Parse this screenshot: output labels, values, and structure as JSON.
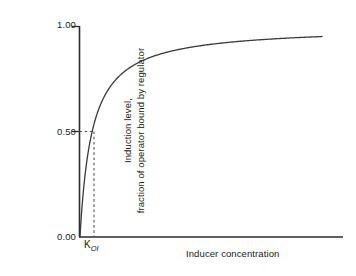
{
  "chart_data": {
    "type": "line",
    "title": "",
    "subtitle": "",
    "xlabel": "Inducer concentration",
    "ylabel": "Induction level, fraction of operator bound by regulator",
    "ylabel_lines": [
      "Induction level,",
      "fraction of operator bound by regulator"
    ],
    "ytick_labels": [
      "1.00",
      "0.50",
      "0.00"
    ],
    "ytick_values": [
      1.0,
      0.5,
      0.0
    ],
    "ylim": [
      0.0,
      1.0
    ],
    "xtick_labels": [
      "K",
      "OI"
    ],
    "xtick_annotation": "K_OI",
    "xlim": [
      0,
      20
    ],
    "grid": false,
    "legend": false,
    "series": [
      {
        "name": "fraction bound",
        "equation": "y = x / (K + x)",
        "K": 1.0,
        "x": [
          0,
          0.1,
          0.2,
          0.3,
          0.4,
          0.5,
          0.7,
          1.0,
          1.3,
          1.7,
          2.1,
          2.6,
          3.2,
          4.0,
          5.0,
          6.2,
          7.6,
          9.2,
          11.0,
          13.0,
          15.2,
          17.5,
          20.0
        ],
        "values": [
          0.0,
          0.091,
          0.167,
          0.231,
          0.286,
          0.333,
          0.412,
          0.5,
          0.565,
          0.63,
          0.677,
          0.722,
          0.762,
          0.8,
          0.833,
          0.861,
          0.884,
          0.902,
          0.917,
          0.929,
          0.938,
          0.946,
          0.952
        ]
      }
    ],
    "annotations": [
      {
        "name": "half-saturation-guide",
        "style": "dashed",
        "y_value": 0.5,
        "x_value": 1.0,
        "label": "K_OI"
      }
    ],
    "colors": {
      "curve": "#3a3a3a",
      "axis": "#2b2b2b",
      "dashed": "#555555",
      "background": "#ffffff",
      "text": "#1a1a1a"
    }
  },
  "axes": {
    "y_tick_top": "1.00",
    "y_tick_mid": "0.50",
    "y_tick_bottom": "0.00",
    "x_axis_title": "Inducer concentration",
    "k_symbol": "K",
    "k_subscript": "OI"
  }
}
